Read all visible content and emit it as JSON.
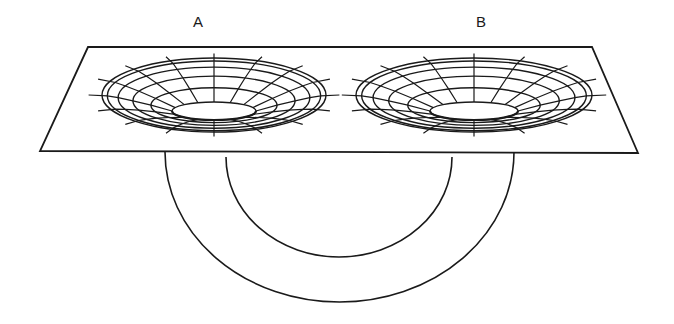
{
  "diagram": {
    "type": "wormhole-embedding",
    "labels": [
      {
        "id": "A",
        "text": "A",
        "x": 193,
        "y": 13
      },
      {
        "id": "B",
        "text": "B",
        "x": 476,
        "y": 13
      }
    ],
    "plane": {
      "points": [
        [
          88,
          47
        ],
        [
          592,
          47
        ],
        [
          638,
          153
        ],
        [
          40,
          151
        ]
      ],
      "stroke": "#1a1a1a"
    },
    "funnels": [
      {
        "name": "mouth-A",
        "cx": 214,
        "top": 58,
        "rx": 112,
        "throat_y": 118,
        "throat_rx": 42
      },
      {
        "name": "mouth-B",
        "cx": 474,
        "top": 58,
        "rx": 118,
        "throat_y": 118,
        "throat_rx": 44
      }
    ],
    "tube": {
      "outer": {
        "left_x": 165,
        "right_x": 514,
        "top_y": 152,
        "bottom_y": 302
      },
      "inner": {
        "left_x": 226,
        "right_x": 452,
        "top_y": 157,
        "bottom_y": 257
      }
    },
    "colors": {
      "ink": "#1a1a1a",
      "background": "#ffffff"
    }
  }
}
